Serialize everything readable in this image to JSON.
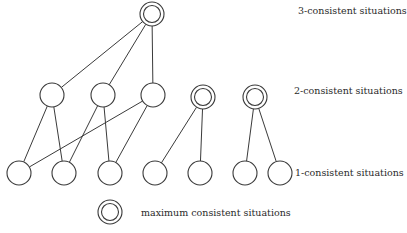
{
  "diagram": {
    "type": "lattice",
    "levels": [
      {
        "id": "level-3",
        "label": "3-consistent situations",
        "label_pos": {
          "x": 298,
          "y": 5
        }
      },
      {
        "id": "level-2",
        "label": "2-consistent situations",
        "label_pos": {
          "x": 294,
          "y": 85
        }
      },
      {
        "id": "level-1",
        "label": "1-consistent situations",
        "label_pos": {
          "x": 295,
          "y": 167
        }
      }
    ],
    "legend": {
      "symbol": "double-circle",
      "label": "maximum consistent situations",
      "symbol_pos": {
        "x": 110,
        "y": 212
      },
      "label_pos": {
        "x": 141,
        "y": 207
      }
    },
    "nodes": [
      {
        "id": "t1",
        "level": 3,
        "x": 152,
        "y": 14,
        "maximal": true
      },
      {
        "id": "m1",
        "level": 2,
        "x": 52,
        "y": 95,
        "maximal": false
      },
      {
        "id": "m2",
        "level": 2,
        "x": 103,
        "y": 95,
        "maximal": false
      },
      {
        "id": "m3",
        "level": 2,
        "x": 153,
        "y": 95,
        "maximal": false
      },
      {
        "id": "m4",
        "level": 2,
        "x": 203,
        "y": 97,
        "maximal": true
      },
      {
        "id": "m5",
        "level": 2,
        "x": 255,
        "y": 97,
        "maximal": true
      },
      {
        "id": "b1",
        "level": 1,
        "x": 19,
        "y": 173,
        "maximal": false
      },
      {
        "id": "b2",
        "level": 1,
        "x": 64,
        "y": 173,
        "maximal": false
      },
      {
        "id": "b3",
        "level": 1,
        "x": 110,
        "y": 173,
        "maximal": false
      },
      {
        "id": "b4",
        "level": 1,
        "x": 155,
        "y": 173,
        "maximal": false
      },
      {
        "id": "b5",
        "level": 1,
        "x": 200,
        "y": 173,
        "maximal": false
      },
      {
        "id": "b6",
        "level": 1,
        "x": 245,
        "y": 173,
        "maximal": false
      },
      {
        "id": "b7",
        "level": 1,
        "x": 280,
        "y": 173,
        "maximal": false
      }
    ],
    "edges": [
      [
        "t1",
        "m1"
      ],
      [
        "t1",
        "m2"
      ],
      [
        "t1",
        "m3"
      ],
      [
        "m1",
        "b1"
      ],
      [
        "m1",
        "b2"
      ],
      [
        "m2",
        "b2"
      ],
      [
        "m2",
        "b3"
      ],
      [
        "m3",
        "b1"
      ],
      [
        "m3",
        "b3"
      ],
      [
        "m4",
        "b4"
      ],
      [
        "m4",
        "b5"
      ],
      [
        "m5",
        "b6"
      ],
      [
        "m5",
        "b7"
      ]
    ],
    "node_radius": 12,
    "inner_radius": 8.5,
    "stroke_color": "#3a3a3a"
  }
}
